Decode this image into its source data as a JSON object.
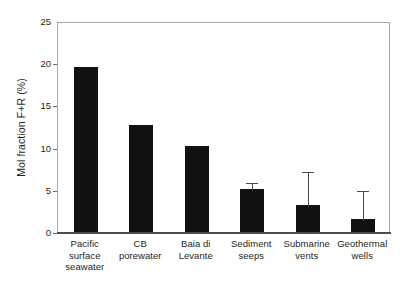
{
  "chart_data": {
    "type": "bar",
    "title": "",
    "subtitle": "",
    "xlabel": "",
    "ylabel": "Mol fraction F+R (%)",
    "ylim": [
      0,
      25
    ],
    "yticks": [
      0,
      5,
      10,
      15,
      20,
      25
    ],
    "ytick_labels": [
      "0",
      "5",
      "10",
      "15",
      "20",
      "25"
    ],
    "grid": false,
    "legend": null,
    "bar_color": "#111111",
    "error_bar_color": "#4a4a4a",
    "frame_color": "#a8a8a8",
    "axis_color": "#4d4d4d",
    "categories": [
      "Pacific surface seawater",
      "CB porewater",
      "Baia di Levante",
      "Sediment seeps",
      "Submarine vents",
      "Geothermal wells"
    ],
    "category_label_lines": [
      [
        "Pacific",
        "surface",
        "seawater"
      ],
      [
        "CB",
        "porewater"
      ],
      [
        "Baia di",
        "Levante"
      ],
      [
        "Sediment",
        "seeps"
      ],
      [
        "Submarine",
        "vents"
      ],
      [
        "Geothermal",
        "wells"
      ]
    ],
    "values": [
      19.6,
      12.7,
      10.2,
      5.1,
      3.2,
      1.5
    ],
    "errors_upper": [
      null,
      null,
      null,
      0.9,
      4.2,
      3.6
    ],
    "errors_lower": [
      null,
      null,
      null,
      null,
      null,
      null
    ],
    "points": [
      {
        "category": "Pacific surface seawater",
        "value": 19.6,
        "error_upper": null
      },
      {
        "category": "CB porewater",
        "value": 12.7,
        "error_upper": null
      },
      {
        "category": "Baia di Levante",
        "value": 10.2,
        "error_upper": null
      },
      {
        "category": "Sediment seeps",
        "value": 5.1,
        "error_upper": 0.9
      },
      {
        "category": "Submarine vents",
        "value": 3.2,
        "error_upper": 4.2
      },
      {
        "category": "Geothermal wells",
        "value": 1.5,
        "error_upper": 3.6
      }
    ]
  }
}
